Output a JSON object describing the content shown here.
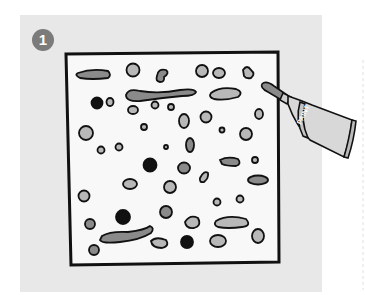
{
  "step": {
    "number": "1"
  },
  "illustration": {
    "subject": "canvas with paint blobs and paint tube",
    "tube_label": "PAINT",
    "colors": {
      "panel": "#e8e8e8",
      "canvas": "#f8f8f8",
      "outline": "#111111",
      "blob_light": "#b8b8b8",
      "blob_mid": "#8a8a8a",
      "blob_dark": "#111111",
      "badge": "#7b7b7b"
    }
  }
}
